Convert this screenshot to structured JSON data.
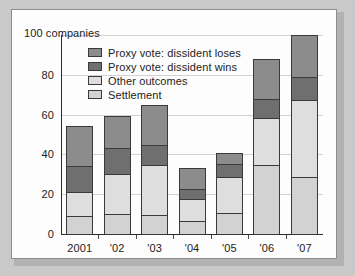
{
  "chart_data": {
    "type": "bar",
    "subtype": "stacked-bar",
    "title": "",
    "xlabel": "",
    "ylabel": "100 companies",
    "axis_note": "100 companies",
    "ylim": [
      0,
      100
    ],
    "yticks": [
      0,
      20,
      40,
      60,
      80,
      100
    ],
    "ytick_labels": [
      "0",
      "20",
      "40",
      "60",
      "80",
      "100 companies"
    ],
    "grid": true,
    "legend_position": "top-left-inside",
    "categories": [
      "2001",
      "'02",
      "'03",
      "'04",
      "'05",
      "'06",
      "'07"
    ],
    "series": [
      {
        "name": "Settlement",
        "color": "#d2d2d2",
        "values": [
          9,
          10,
          9.5,
          6.5,
          10.5,
          34.5,
          28.5
        ]
      },
      {
        "name": "Other outcomes",
        "color": "#dedede",
        "values": [
          12,
          20,
          25,
          11,
          18,
          24,
          39
        ]
      },
      {
        "name": "Proxy vote: dissident wins",
        "color": "#6f6f6f",
        "values": [
          13,
          13,
          10,
          5,
          6.5,
          9.5,
          11.5
        ]
      },
      {
        "name": "Proxy vote: dissident loses",
        "color": "#8c8c8c",
        "values": [
          20.5,
          16.5,
          20.5,
          10.5,
          5.5,
          20,
          21
        ]
      }
    ],
    "cumulative_tops": {
      "2001": [
        9,
        21,
        34,
        54.5
      ],
      "'02": [
        10,
        30,
        43,
        59.5
      ],
      "'03": [
        9.5,
        34.5,
        44.5,
        65
      ],
      "'04": [
        6.5,
        17.5,
        22.5,
        33
      ],
      "'05": [
        10.5,
        28.5,
        35,
        40.5
      ],
      "'06": [
        34.5,
        58.5,
        68,
        88
      ],
      "'07": [
        28.5,
        67.5,
        79,
        100
      ]
    },
    "totals": [
      54.5,
      59.5,
      65,
      33,
      40.5,
      88,
      100
    ]
  },
  "legend": {
    "items": [
      {
        "label": "Proxy vote: dissident loses",
        "color": "#8c8c8c"
      },
      {
        "label": "Proxy vote: dissident wins",
        "color": "#6f6f6f"
      },
      {
        "label": "Other outcomes",
        "color": "#dedede"
      },
      {
        "label": "Settlement",
        "color": "#d2d2d2"
      }
    ]
  }
}
